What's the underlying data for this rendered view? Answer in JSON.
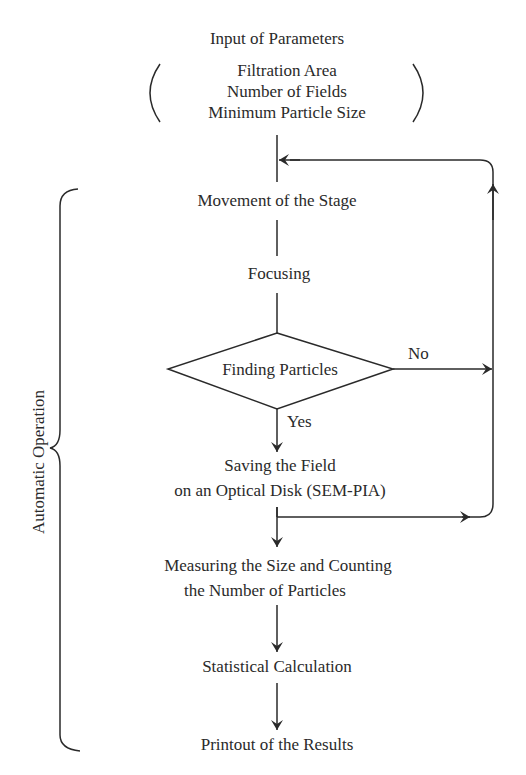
{
  "diagram": {
    "type": "flowchart",
    "title_step": "Input of Parameters",
    "parameters": [
      "Filtration Area",
      "Number of Fields",
      "Minimum Particle Size"
    ],
    "steps": {
      "movement": "Movement of the Stage",
      "focusing": "Focusing",
      "decision": "Finding Particles",
      "saving_line1": "Saving the Field",
      "saving_line2": "on an Optical Disk (SEM-PIA)",
      "measuring_line1": "Measuring the Size and Counting",
      "measuring_line2": "the Number of Particles",
      "statistics": "Statistical Calculation",
      "printout": "Printout of the Results"
    },
    "branch_labels": {
      "no": "No",
      "yes": "Yes"
    },
    "bracket_label": "Automatic Operation",
    "edges": [
      {
        "from": "Input of Parameters",
        "to": "Movement of the Stage"
      },
      {
        "from": "Movement of the Stage",
        "to": "Focusing"
      },
      {
        "from": "Focusing",
        "to": "Finding Particles"
      },
      {
        "from": "Finding Particles",
        "to": "Saving the Field on an Optical Disk (SEM-PIA)",
        "label": "Yes"
      },
      {
        "from": "Finding Particles",
        "to": "Movement of the Stage",
        "label": "No"
      },
      {
        "from": "Saving the Field on an Optical Disk (SEM-PIA)",
        "to": "Movement of the Stage"
      },
      {
        "from": "Saving the Field on an Optical Disk (SEM-PIA)",
        "to": "Measuring the Size and Counting the Number of Particles"
      },
      {
        "from": "Measuring the Size and Counting the Number of Particles",
        "to": "Statistical Calculation"
      },
      {
        "from": "Statistical Calculation",
        "to": "Printout of the Results"
      }
    ]
  }
}
